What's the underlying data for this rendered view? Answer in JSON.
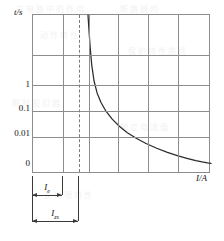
{
  "figure": {
    "y_axis_title": "t/s",
    "x_axis_title": "I/A"
  },
  "annotations": {
    "rated_current": {
      "symbol": "I",
      "subscript": "e",
      "label": "Ie"
    },
    "instantaneous_current": {
      "symbol": "I",
      "subscript": "zs",
      "label": "Izs"
    }
  },
  "colors": {
    "curve": "#2b2b2b",
    "grid": "#8d8d8d",
    "frame": "#8d8d8d",
    "dashed_marker": "#7a7a7a",
    "dimension": "#3a3a3a",
    "text": "#111111",
    "background": "#ffffff"
  },
  "ghost_text": [
    "在电路中的作用",
    "断路器的",
    "动作特性",
    "保护特性曲线",
    "瞬时脱扣器",
    "额定电流值",
    "反时限特性"
  ],
  "chart_data": {
    "type": "line",
    "title": "",
    "subtitle": "",
    "xlabel": "I/A",
    "ylabel": "t/s",
    "ylabel_full": "t/s",
    "x_scale": "linear",
    "y_scale": "log-like (decade tick labels 1, 0.1, 0.01, 0)",
    "ytick_labels": [
      "1",
      "0.1",
      "0.01",
      "0"
    ],
    "ytick_fractions": [
      0.4375,
      0.5938,
      0.75,
      0.9375
    ],
    "xtick_labels": [],
    "grid": true,
    "grid_vertical_fractions": [
      0.0,
      0.1685,
      0.3146,
      0.4775,
      0.6461,
      0.8146,
      1.0
    ],
    "grid_horizontal_fractions": [
      0.0,
      0.2516,
      0.4403,
      0.6038,
      0.7673,
      1.0
    ],
    "legend": "none",
    "series": [
      {
        "name": "tripping-time curve",
        "style": "solid",
        "points": [
          [
            0.309,
            0.0
          ],
          [
            0.314,
            0.088
          ],
          [
            0.321,
            0.2
          ],
          [
            0.33,
            0.315
          ],
          [
            0.343,
            0.415
          ],
          [
            0.36,
            0.49
          ],
          [
            0.382,
            0.55
          ],
          [
            0.41,
            0.605
          ],
          [
            0.445,
            0.655
          ],
          [
            0.485,
            0.7
          ],
          [
            0.53,
            0.74
          ],
          [
            0.58,
            0.775
          ],
          [
            0.635,
            0.808
          ],
          [
            0.695,
            0.838
          ],
          [
            0.755,
            0.864
          ],
          [
            0.815,
            0.886
          ],
          [
            0.87,
            0.903
          ],
          [
            0.915,
            0.916
          ],
          [
            0.95,
            0.924
          ],
          [
            0.98,
            0.93
          ],
          [
            1.0,
            0.933
          ]
        ]
      }
    ],
    "markers": [
      {
        "name": "dashed-threshold-line",
        "style": "dashed-vertical",
        "x_fraction": 0.2584
      },
      {
        "name": "solid-threshold-line",
        "style": "solid-vertical",
        "x_fraction": 0.3146
      }
    ],
    "dimensions": [
      {
        "name": "Ie",
        "label": "Ie",
        "from_fraction": 0.0,
        "to_fraction": 0.1685,
        "row": 1
      },
      {
        "name": "Izs",
        "label": "Izs",
        "from_fraction": 0.0,
        "to_fraction": 0.2584,
        "row": 2
      }
    ]
  }
}
